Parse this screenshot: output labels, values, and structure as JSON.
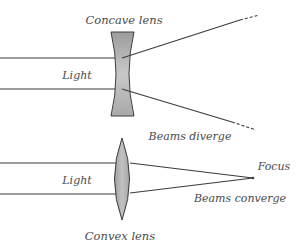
{
  "diagram": {
    "concave": {
      "label": "Concave lens",
      "light_label": "Light",
      "result_label": "Beams diverge",
      "fill_color": "#b5b5b5"
    },
    "convex": {
      "label": "Convex lens",
      "light_label": "Light",
      "result_label": "Beams converge",
      "focus_label": "Focus",
      "fill_color": "#b0b0b0"
    },
    "ray_color": "#3a3a3a",
    "text_color": "#4a4a4a"
  }
}
